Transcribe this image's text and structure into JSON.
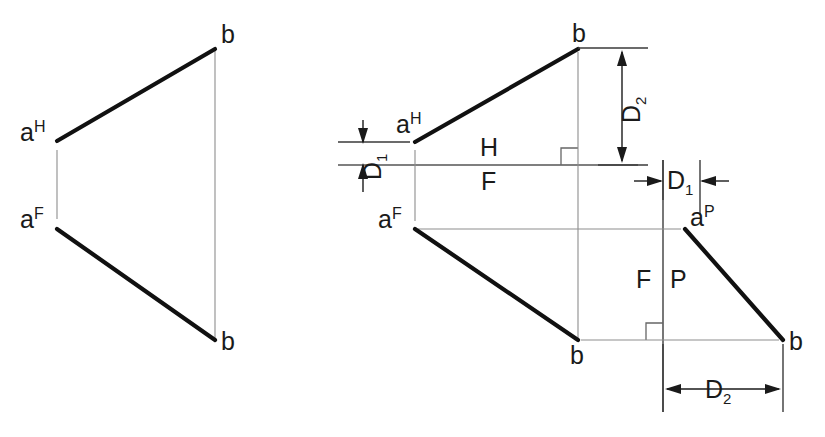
{
  "figure": {
    "background_color": "#ffffff",
    "object_line_color": "#111111",
    "projection_line_color": "#8d8d8d",
    "fold_line_color": "#555555",
    "dimension_color": "#1a1a1a"
  },
  "left_view": {
    "name": "given-two-view-drawing",
    "labels": {
      "a_h": "a",
      "a_h_sup": "H",
      "a_f": "a",
      "a_f_sup": "F",
      "b_top": "b",
      "b_bottom": "b"
    },
    "points": {
      "a_h": [
        57,
        141
      ],
      "a_f": [
        57,
        227
      ],
      "b_top": [
        215,
        48
      ],
      "b_bottom": [
        215,
        340
      ]
    }
  },
  "right_view": {
    "name": "solution-three-view-drawing",
    "labels": {
      "a_h": "a",
      "a_h_sup": "H",
      "a_f": "a",
      "a_f_sup": "F",
      "a_p": "a",
      "a_p_sup": "P",
      "b_top": "b",
      "b_front": "b",
      "b_profile": "b",
      "fold_hf_upper": "H",
      "fold_hf_lower": "F",
      "fold_fp_left": "F",
      "fold_fp_right": "P"
    },
    "dimensions": {
      "d1_left": "D",
      "d1_left_sub": "1",
      "d1_right": "D",
      "d1_right_sub": "1",
      "d2_top": "D",
      "d2_top_sub": "2",
      "d2_bottom": "D",
      "d2_bottom_sub": "2"
    },
    "points": {
      "a_h": [
        415,
        142
      ],
      "a_f": [
        415,
        229
      ],
      "a_p": [
        685,
        229
      ],
      "b_top": [
        578,
        48
      ],
      "b_front": [
        578,
        340
      ],
      "b_profile": [
        783,
        340
      ]
    },
    "fold_lines": {
      "hf_horizontal_y": 165,
      "hf_x_range": [
        338,
        638
      ],
      "fp_vertical_x": 663,
      "fp_y_range": [
        160,
        410
      ]
    }
  }
}
